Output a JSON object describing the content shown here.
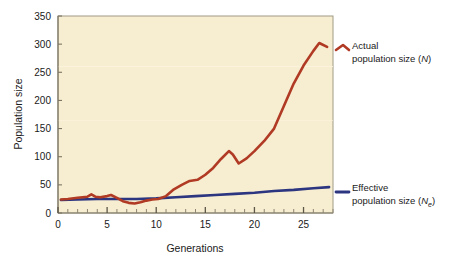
{
  "chart_data": {
    "type": "line",
    "title": "",
    "xlabel": "Generations",
    "ylabel": "Population size",
    "xlim": [
      0,
      28
    ],
    "ylim": [
      0,
      350
    ],
    "xticks": [
      0,
      5,
      10,
      15,
      20,
      25
    ],
    "yticks": [
      0,
      50,
      100,
      150,
      200,
      250,
      300,
      350
    ],
    "xtick_labels": [
      "0",
      "5",
      "10",
      "15",
      "20",
      "25"
    ],
    "ytick_labels": [
      "0",
      "50",
      "100",
      "150",
      "200",
      "250",
      "300",
      "350"
    ],
    "minor_xtick_interval": 1,
    "grid": false,
    "legend_position": "right-outside",
    "plot_background": "#f7edd0",
    "series": [
      {
        "name": "Actual population size (N)",
        "label_line1": "Actual",
        "label_line2_prefix": "population size (",
        "label_symbol": "N",
        "label_subscript": "",
        "label_line2_suffix": ")",
        "color": "#b03a24",
        "x": [
          0.3,
          1,
          2,
          3,
          3.4,
          3.8,
          4.3,
          5,
          5.4,
          6,
          6.6,
          7.2,
          7.8,
          8.4,
          9,
          9.6,
          10.2,
          11,
          11.8,
          12.6,
          13.4,
          14.2,
          15,
          15.8,
          16.6,
          17.4,
          17.8,
          18.4,
          19.2,
          20,
          21,
          22,
          23,
          24,
          25,
          26,
          26.6,
          27.4
        ],
        "y": [
          24,
          25,
          27,
          29,
          33,
          29,
          28,
          30,
          32,
          27,
          21,
          18,
          17,
          19,
          22,
          24,
          25,
          30,
          42,
          50,
          57,
          59,
          68,
          80,
          96,
          110,
          104,
          88,
          97,
          110,
          128,
          150,
          190,
          230,
          262,
          288,
          302,
          295
        ]
      },
      {
        "name": "Effective population size (Ne)",
        "label_line1": "Effective",
        "label_line2_prefix": "population size (",
        "label_symbol": "N",
        "label_subscript": "e",
        "label_line2_suffix": ")",
        "color": "#2b3580",
        "x": [
          0.3,
          2,
          4,
          6,
          8,
          10,
          12,
          14,
          16,
          18,
          20,
          22,
          24,
          26,
          27.6
        ],
        "y": [
          23,
          24,
          25,
          25,
          25,
          26,
          28,
          30,
          32,
          34,
          36,
          39,
          41,
          44,
          46
        ]
      }
    ]
  },
  "axes": {
    "y_title": "Population size",
    "x_title": "Generations"
  },
  "legend": {
    "actual": {
      "line1": "Actual",
      "line2_prefix": "population size (",
      "symbol": "N",
      "sub": "",
      "line2_suffix": ")"
    },
    "effective": {
      "line1": "Effective",
      "line2_prefix": "population size (",
      "symbol": "N",
      "sub": "e",
      "line2_suffix": ")"
    }
  }
}
